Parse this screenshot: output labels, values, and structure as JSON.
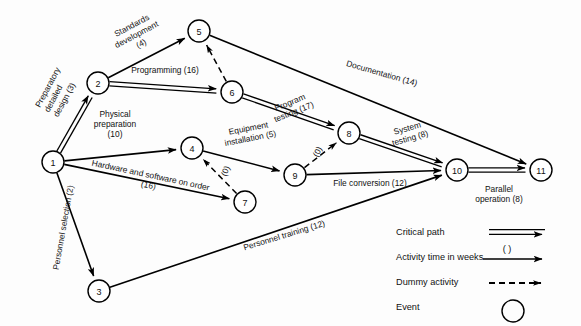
{
  "diagram": {
    "colors": {
      "ink": "#000000",
      "paper": "#fdfdfd"
    },
    "nodes": [
      {
        "id": "1",
        "label": "1",
        "x": 53,
        "y": 162
      },
      {
        "id": "2",
        "label": "2",
        "x": 98,
        "y": 83
      },
      {
        "id": "3",
        "label": "3",
        "x": 99,
        "y": 291
      },
      {
        "id": "4",
        "label": "4",
        "x": 192,
        "y": 148
      },
      {
        "id": "5",
        "label": "5",
        "x": 199,
        "y": 31
      },
      {
        "id": "6",
        "label": "6",
        "x": 232,
        "y": 92
      },
      {
        "id": "7",
        "label": "7",
        "x": 245,
        "y": 202
      },
      {
        "id": "8",
        "label": "8",
        "x": 349,
        "y": 133
      },
      {
        "id": "9",
        "label": "9",
        "x": 295,
        "y": 175
      },
      {
        "id": "10",
        "label": "10",
        "x": 457,
        "y": 170
      },
      {
        "id": "11",
        "label": "11",
        "x": 541,
        "y": 170
      }
    ],
    "node_radius": 11,
    "edges": [
      {
        "from": "1",
        "to": "2",
        "type": "critical",
        "name": "edge-1-2",
        "label": "Preparatory\ndetailed\ndesign (3)",
        "lx": 40,
        "ly": 108,
        "rot": -62,
        "anchor": "start",
        "lines": 3
      },
      {
        "from": "1",
        "to": "3",
        "type": "single",
        "name": "edge-1-3",
        "label": "Personnel selection (2)",
        "lx": 66,
        "ly": 228,
        "rot": -80,
        "anchor": "middle",
        "lines": 1
      },
      {
        "from": "1",
        "to": "4",
        "type": "single",
        "name": "edge-1-4",
        "label": "Physical\npreparation\n(10)",
        "lx": 115,
        "ly": 117,
        "rot": 0,
        "anchor": "middle",
        "lines": 3
      },
      {
        "from": "1",
        "to": "7",
        "type": "single",
        "name": "edge-1-7",
        "label": "Hardware and software on order\n(16)",
        "lx": 150,
        "ly": 178,
        "rot": 12,
        "anchor": "middle",
        "lines": 2
      },
      {
        "from": "2",
        "to": "5",
        "type": "single",
        "name": "edge-2-5",
        "label": "Standards\ndevelopment\n(4)",
        "lx": 133,
        "ly": 28,
        "rot": -28,
        "anchor": "middle",
        "lines": 3
      },
      {
        "from": "2",
        "to": "6",
        "type": "critical",
        "name": "edge-2-6",
        "label": "Programming (16)",
        "lx": 165,
        "ly": 73,
        "rot": 0,
        "anchor": "middle",
        "lines": 1
      },
      {
        "from": "3",
        "to": "10",
        "type": "single",
        "name": "edge-3-10",
        "label": "Personnel training (12)",
        "lx": 285,
        "ly": 238,
        "rot": -17,
        "anchor": "middle",
        "lines": 1
      },
      {
        "from": "4",
        "to": "9",
        "type": "single",
        "name": "edge-4-9",
        "label": "Equipment\ninstallation (5)",
        "lx": 249,
        "ly": 131,
        "rot": -11,
        "anchor": "middle",
        "lines": 2
      },
      {
        "from": "5",
        "to": "11",
        "type": "single",
        "name": "edge-5-11",
        "label": "Documentation (14)",
        "lx": 381,
        "ly": 76,
        "rot": 16,
        "anchor": "middle",
        "lines": 1
      },
      {
        "from": "6",
        "to": "5",
        "type": "dummy",
        "name": "edge-6-5",
        "label": "",
        "lx": 0,
        "ly": 0,
        "rot": 0,
        "lines": 0
      },
      {
        "from": "6",
        "to": "8",
        "type": "critical",
        "name": "edge-6-8",
        "label": "Program\ntesting (17)",
        "lx": 291,
        "ly": 105,
        "rot": -22,
        "anchor": "middle",
        "lines": 2
      },
      {
        "from": "7",
        "to": "4",
        "type": "dummy",
        "name": "edge-7-4",
        "label": "(0)",
        "lx": 228,
        "ly": 172,
        "rot": -66,
        "anchor": "middle",
        "lines": 1
      },
      {
        "from": "8",
        "to": "10",
        "type": "critical",
        "name": "edge-8-10",
        "label": "System\ntesting (8)",
        "lx": 408,
        "ly": 131,
        "rot": -16,
        "anchor": "middle",
        "lines": 2
      },
      {
        "from": "9",
        "to": "8",
        "type": "dummy",
        "name": "edge-9-8",
        "label": "(0)",
        "lx": 320,
        "ly": 153,
        "rot": -62,
        "anchor": "middle",
        "lines": 1
      },
      {
        "from": "9",
        "to": "10",
        "type": "single",
        "name": "edge-9-10",
        "label": "File conversion (12)",
        "lx": 370,
        "ly": 186,
        "rot": 0,
        "anchor": "middle",
        "lines": 1
      },
      {
        "from": "10",
        "to": "11",
        "type": "critical",
        "name": "edge-10-11",
        "label": "Parallel\noperation (8)",
        "lx": 499,
        "ly": 192,
        "rot": 0,
        "anchor": "middle",
        "lines": 2
      }
    ]
  },
  "legend": {
    "items": [
      {
        "label": "Critical path",
        "symbol": "double-arrow",
        "name": "legend-critical-path"
      },
      {
        "label": "Activity time in weeks",
        "symbol": "arrow-with-parens",
        "name": "legend-activity-time",
        "note": "( )"
      },
      {
        "label": "Dummy activity",
        "symbol": "dashed-arrow",
        "name": "legend-dummy-activity"
      },
      {
        "label": "Event",
        "symbol": "circle",
        "name": "legend-event"
      }
    ]
  }
}
